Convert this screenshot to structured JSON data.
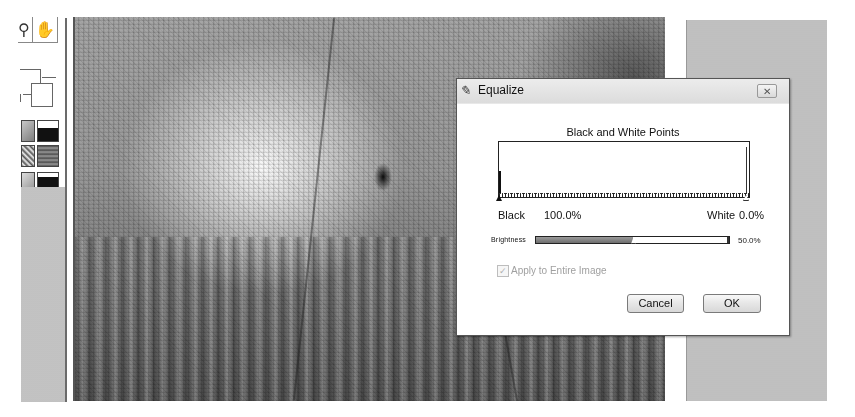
{
  "toolbar": {
    "tools": [
      {
        "name": "zoom-tool",
        "icon": "magnifier-icon",
        "glyph": "⚲"
      },
      {
        "name": "hand-tool",
        "icon": "hand-icon",
        "glyph": "✋"
      }
    ],
    "color_swatch": {
      "foreground": "#ffffff",
      "background": "#ffffff"
    },
    "thumbnails": [
      "thumb-1",
      "thumb-2",
      "thumb-3",
      "thumb-4",
      "thumb-5",
      "thumb-6"
    ]
  },
  "canvas": {
    "description": "Grayscale stippled photo of a horse head"
  },
  "dialog": {
    "title": "Equalize",
    "title_icon": "brush-icon",
    "title_icon_glyph": "✎",
    "close_glyph": "✕",
    "section_title": "Black and White Points",
    "black_label": "Black",
    "black_value": "100.0%",
    "white_label": "White",
    "white_value": "0.0%",
    "brightness_label": "Brightness",
    "brightness_value": "50.0%",
    "brightness_percent": 50,
    "apply_checkbox": {
      "label": "Apply to Entire Image",
      "checked": true,
      "disabled": true,
      "glyph": "✓"
    },
    "buttons": {
      "cancel": "Cancel",
      "ok": "OK"
    }
  },
  "colors": {
    "dialog_bg": "#ffffff",
    "title_bar": "#e0e0e0",
    "panel_gray": "#bfbfbf",
    "disabled_text": "#a0a0a0"
  }
}
